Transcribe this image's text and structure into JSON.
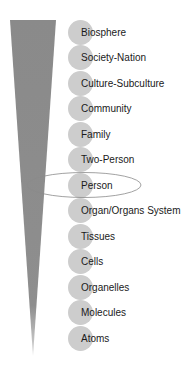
{
  "diagram": {
    "title": "",
    "wedge_color": "#8c8c8c",
    "circle_color": "#cdcdcd",
    "highlighted_level": "Person",
    "levels": [
      {
        "label": "Biosphere"
      },
      {
        "label": "Society-Nation"
      },
      {
        "label": "Culture-Subculture"
      },
      {
        "label": "Community"
      },
      {
        "label": "Family"
      },
      {
        "label": "Two-Person"
      },
      {
        "label": "Person"
      },
      {
        "label": "Organ/Organs System"
      },
      {
        "label": "Tissues"
      },
      {
        "label": "Cells"
      },
      {
        "label": "Organelles"
      },
      {
        "label": "Molecules"
      },
      {
        "label": "Atoms"
      }
    ]
  }
}
